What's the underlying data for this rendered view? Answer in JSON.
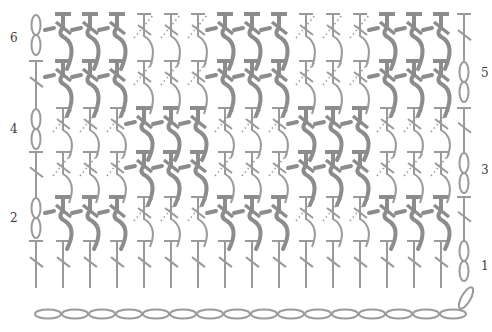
{
  "diagram": {
    "type": "crochet-stitch-chart",
    "stitch_color": "#9a9a9a",
    "post_color": "#8c8c8c",
    "columns": 15,
    "rows": 6,
    "row_labels": [
      {
        "row": 1,
        "label": "1",
        "side": "right"
      },
      {
        "row": 2,
        "label": "2",
        "side": "left"
      },
      {
        "row": 3,
        "label": "3",
        "side": "right"
      },
      {
        "row": 4,
        "label": "4",
        "side": "left"
      },
      {
        "row": 5,
        "label": "5",
        "side": "right"
      },
      {
        "row": 6,
        "label": "6",
        "side": "left"
      }
    ],
    "foundation": {
      "symbol": "chain",
      "count": 16
    },
    "row_stitches": [
      {
        "row": 1,
        "pattern": "dc-all"
      },
      {
        "row": 2,
        "pattern": "post-groups",
        "post_columns": [
          1,
          2,
          3,
          7,
          8,
          9,
          13,
          14,
          15
        ]
      },
      {
        "row": 3,
        "pattern": "post-groups",
        "post_columns": [
          4,
          5,
          6,
          10,
          11,
          12
        ]
      },
      {
        "row": 4,
        "pattern": "post-groups",
        "post_columns": [
          4,
          5,
          6,
          10,
          11,
          12
        ]
      },
      {
        "row": 5,
        "pattern": "post-groups",
        "post_columns": [
          1,
          2,
          3,
          7,
          8,
          9,
          13,
          14,
          15
        ]
      },
      {
        "row": 6,
        "pattern": "post-groups",
        "post_columns": [
          1,
          2,
          3,
          7,
          8,
          9,
          13,
          14,
          15
        ]
      }
    ],
    "turning_chains": [
      {
        "row": 1,
        "side": "right"
      },
      {
        "row": 2,
        "side": "left"
      },
      {
        "row": 3,
        "side": "right"
      },
      {
        "row": 4,
        "side": "left"
      },
      {
        "row": 5,
        "side": "right"
      },
      {
        "row": 6,
        "side": "left"
      }
    ]
  },
  "labels": {
    "r1": "1",
    "r2": "2",
    "r3": "3",
    "r4": "4",
    "r5": "5",
    "r6": "6"
  }
}
